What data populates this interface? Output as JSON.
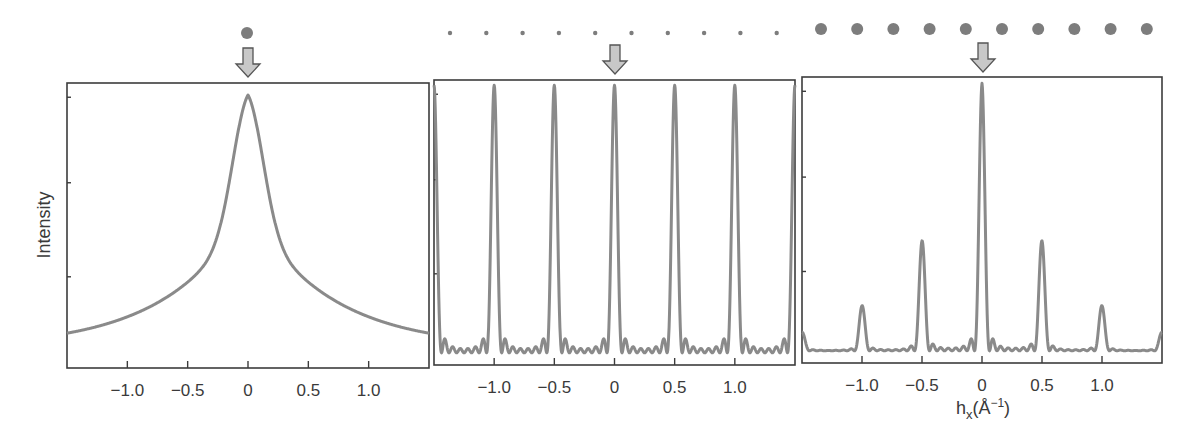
{
  "figure": {
    "ylabel": "Intensity",
    "xlabel_main": "h",
    "xlabel_sub": "x",
    "xlabel_unit": "(Å",
    "xlabel_sup": "−1",
    "xlabel_close": ")",
    "line_color": "#8a8a8a",
    "dot_color": "#7d7d7d"
  },
  "chart_data": [
    {
      "type": "line",
      "panel": "single atom",
      "title": "",
      "xlabel": "",
      "ylabel": "Intensity",
      "xlim": [
        -1.5,
        1.5
      ],
      "x_ticks": [
        "−1.0",
        "−0.5",
        "0",
        "0.5",
        "1.0"
      ],
      "x_tick_values": [
        -1.0,
        -0.5,
        0,
        0.5,
        1.0
      ],
      "description": "Single broad Lorentzian-like peak centered at 0",
      "x": [
        -1.5,
        -1.0,
        -0.5,
        -0.25,
        0,
        0.25,
        0.5,
        1.0,
        1.5
      ],
      "y": [
        0.0,
        0.16,
        0.37,
        0.62,
        1.0,
        0.62,
        0.37,
        0.16,
        0.0
      ],
      "illustration": {
        "dots": 1,
        "dot_size": "large"
      }
    },
    {
      "type": "line",
      "panel": "lattice of point scatterers",
      "title": "",
      "xlabel": "",
      "ylabel": "",
      "xlim": [
        -1.5,
        1.5
      ],
      "x_ticks": [
        "−1.0",
        "−0.5",
        "0",
        "0.5",
        "1.0"
      ],
      "x_tick_values": [
        -1.0,
        -0.5,
        0,
        0.5,
        1.0
      ],
      "description": "Sharp Bragg peaks of equal intensity every 0.5 Å⁻¹ with small side fringes",
      "peak_positions": [
        -1.5,
        -1.0,
        -0.5,
        0,
        0.5,
        1.0,
        1.5
      ],
      "peak_heights": [
        1.0,
        1.0,
        1.0,
        1.0,
        1.0,
        1.0,
        1.0
      ],
      "illustration": {
        "dots": 10,
        "dot_size": "small"
      }
    },
    {
      "type": "line",
      "panel": "crystal (lattice × atom)",
      "title": "",
      "xlabel": "hx (Å−1)",
      "ylabel": "",
      "xlim": [
        -1.5,
        1.5
      ],
      "x_ticks": [
        "−1.0",
        "−0.5",
        "0",
        "0.5",
        "1.0"
      ],
      "x_tick_values": [
        -1.0,
        -0.5,
        0,
        0.5,
        1.0
      ],
      "description": "Bragg peaks modulated by the atomic form factor envelope",
      "peak_positions": [
        -1.5,
        -1.0,
        -0.5,
        0,
        0.5,
        1.0,
        1.5
      ],
      "peak_heights": [
        0.08,
        0.2,
        0.41,
        1.0,
        0.41,
        0.2,
        0.08
      ],
      "illustration": {
        "dots": 10,
        "dot_size": "large"
      }
    }
  ]
}
